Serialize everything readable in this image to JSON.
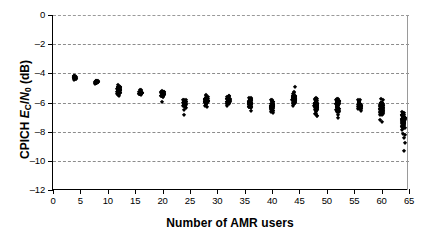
{
  "chart_data": {
    "type": "scatter",
    "title": "",
    "xlabel": "Number of AMR users",
    "ylabel_parts": {
      "prefix": "CPICH ",
      "e": "E",
      "e_sub": "C",
      "slash": "/",
      "n": "N",
      "n_sub": "0",
      "units": " (dB)"
    },
    "ylabel": "CPICH Ec/N0 (dB)",
    "xlim": [
      0,
      65
    ],
    "ylim": [
      -12,
      0
    ],
    "xticks": [
      0,
      5,
      10,
      15,
      20,
      25,
      30,
      35,
      40,
      45,
      50,
      55,
      60,
      65
    ],
    "yticks": [
      0,
      -2,
      -4,
      -6,
      -8,
      -10,
      -12
    ],
    "xtick_labels": [
      "0",
      "5",
      "10",
      "15",
      "20",
      "25",
      "30",
      "35",
      "40",
      "45",
      "50",
      "55",
      "60",
      "65"
    ],
    "ytick_labels": [
      "0",
      "–2",
      "–4",
      "–6",
      "–8",
      "–10",
      "–12"
    ],
    "grid": {
      "horizontal": true,
      "vertical": false,
      "style": "dashed",
      "color": "#8c8c8c"
    },
    "legend": null,
    "marker": {
      "shape": "diamond",
      "color": "#000000",
      "size": 3.2
    },
    "series": [
      {
        "name": "CPICH Ec/N0 samples",
        "x": [
          4,
          8,
          12,
          16,
          20,
          24,
          28,
          32,
          36,
          40,
          44,
          48,
          52,
          56,
          60,
          64
        ],
        "y_min": [
          -4.55,
          -4.8,
          -5.95,
          -5.7,
          -6.05,
          -6.9,
          -6.45,
          -6.4,
          -7.0,
          -7.05,
          -6.6,
          -7.85,
          -7.6,
          -7.25,
          -8.25,
          -9.4
        ],
        "y_max": [
          -4.1,
          -4.4,
          -4.55,
          -5.0,
          -5.1,
          -5.5,
          -5.15,
          -5.25,
          -5.35,
          -5.45,
          -4.75,
          -5.25,
          -5.25,
          -5.25,
          -5.5,
          -5.65
        ],
        "y_median": [
          -4.3,
          -4.6,
          -5.15,
          -5.35,
          -5.45,
          -6.05,
          -5.9,
          -5.9,
          -6.05,
          -6.25,
          -5.8,
          -6.15,
          -6.2,
          -6.15,
          -6.45,
          -7.25
        ],
        "points_per_column": [
          22,
          22,
          30,
          26,
          30,
          30,
          34,
          34,
          34,
          30,
          38,
          40,
          38,
          36,
          44,
          46
        ],
        "outliers": [
          {
            "x": 24,
            "y": -6.85
          },
          {
            "x": 64,
            "y": -9.3
          }
        ]
      }
    ]
  },
  "axes": {
    "x_title": "Number of AMR users",
    "y_title": "CPICH Ec/N0 (dB)"
  }
}
